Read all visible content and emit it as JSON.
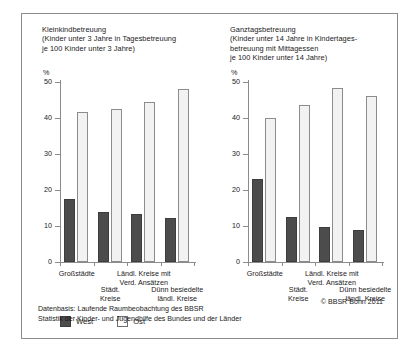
{
  "figure": {
    "footnote": "Datenbasis: Laufende Raumbeobachtung des BBSR\nStatistik der Kinder- und Jugendhilfe des Bundes und der Länder",
    "copyright": "© BBSR Bonn 2011",
    "legend": {
      "west_label": "West",
      "ost_label": "Ost",
      "west_color": "#4c4c4c",
      "ost_color": "#f2f2f2"
    }
  },
  "chart_data": [
    {
      "type": "bar",
      "title": "Kleinkindbetreuung\n(Kinder unter 3 Jahre in Tagesbetreuung\nje 100 Kinder unter 3 Jahre)",
      "xlabel": "",
      "ylabel": "%",
      "ylim": [
        0,
        50
      ],
      "yticks": [
        0,
        10,
        20,
        30,
        40,
        50
      ],
      "ytick_labels": [
        "0",
        "10",
        "20",
        "30",
        "40",
        "50"
      ],
      "grid": false,
      "legend_position": "below",
      "categories": [
        "Großstädte",
        "Städt.\nKreise",
        "Ländl. Kreise mit\nVerd. Ansätzen",
        "Dünn besiedelte\nländl. Kreise"
      ],
      "series": [
        {
          "name": "West",
          "color": "#4c4c4c",
          "values": [
            17.5,
            14.0,
            13.3,
            12.2
          ]
        },
        {
          "name": "Ost",
          "color": "#f2f2f2",
          "values": [
            41.8,
            42.5,
            44.5,
            48.0
          ]
        }
      ]
    },
    {
      "type": "bar",
      "title": "Ganztagsbetreuung\n(Kinder unter 14 Jahre in Kindertages-\nbetreuung mit Mittagessen\nje 100 Kinder unter 14 Jahre)",
      "xlabel": "",
      "ylabel": "%",
      "ylim": [
        0,
        50
      ],
      "yticks": [
        0,
        10,
        20,
        30,
        40,
        50
      ],
      "ytick_labels": [
        "0",
        "10",
        "20",
        "30",
        "40",
        "50"
      ],
      "grid": false,
      "legend_position": "below",
      "categories": [
        "Großstädte",
        "Städt.\nKreise",
        "Ländl. Kreise mit\nVerd. Ansätzen",
        "Dünn besiedelte\nländl. Kreise"
      ],
      "series": [
        {
          "name": "West",
          "color": "#4c4c4c",
          "values": [
            23.0,
            12.5,
            9.8,
            9.0
          ]
        },
        {
          "name": "Ost",
          "color": "#f2f2f2",
          "values": [
            40.0,
            43.7,
            48.4,
            46.2
          ]
        }
      ]
    }
  ]
}
